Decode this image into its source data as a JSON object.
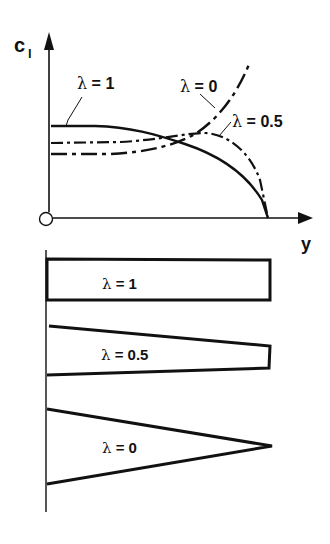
{
  "figure": {
    "top_plot": {
      "y_axis_label_main": "c",
      "y_axis_label_sub": "l",
      "x_axis_label": "y",
      "curves": [
        {
          "label_symbol": "λ",
          "label_eq": " = 1",
          "style": "solid"
        },
        {
          "label_symbol": "λ",
          "label_eq": " = 0",
          "style": "long-dash-dot"
        },
        {
          "label_symbol": "λ",
          "label_eq": " = 0.5",
          "style": "dash-dot"
        }
      ]
    },
    "planforms": [
      {
        "shape": "rectangle",
        "label_symbol": "λ",
        "label_eq": " = 1"
      },
      {
        "shape": "trapezoid",
        "label_symbol": "λ",
        "label_eq": " = 0.5"
      },
      {
        "shape": "triangle",
        "label_symbol": "λ",
        "label_eq": " = 0"
      }
    ],
    "colors": {
      "ink": "#111111",
      "background": "#ffffff"
    }
  }
}
